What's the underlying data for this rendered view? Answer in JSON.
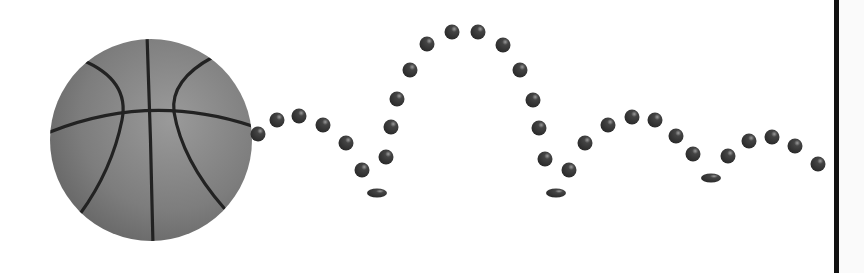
{
  "scene": {
    "title": "Bouncing basketball trajectory",
    "background": "#ffffff",
    "ball": {
      "cx": 151,
      "cy": 140,
      "r": 101,
      "fill_light": "#8a8a8a",
      "fill_dark": "#5a5a5a",
      "seam_color": "#222222"
    },
    "dot_color": "#333333",
    "dots": [
      {
        "x": 258,
        "y": 134,
        "r": 7.5
      },
      {
        "x": 277,
        "y": 120,
        "r": 7.5
      },
      {
        "x": 299,
        "y": 116,
        "r": 7.5
      },
      {
        "x": 323,
        "y": 125,
        "r": 7.5
      },
      {
        "x": 346,
        "y": 143,
        "r": 7.5
      },
      {
        "x": 362,
        "y": 170,
        "r": 7.5
      },
      {
        "x": 386,
        "y": 157,
        "r": 7.5
      },
      {
        "x": 391,
        "y": 127,
        "r": 7.5
      },
      {
        "x": 397,
        "y": 99,
        "r": 7.5
      },
      {
        "x": 410,
        "y": 70,
        "r": 7.5
      },
      {
        "x": 427,
        "y": 44,
        "r": 7.5
      },
      {
        "x": 452,
        "y": 32,
        "r": 7.5
      },
      {
        "x": 478,
        "y": 32,
        "r": 7.5
      },
      {
        "x": 503,
        "y": 45,
        "r": 7.5
      },
      {
        "x": 520,
        "y": 70,
        "r": 7.5
      },
      {
        "x": 533,
        "y": 100,
        "r": 7.5
      },
      {
        "x": 539,
        "y": 128,
        "r": 7.5
      },
      {
        "x": 545,
        "y": 159,
        "r": 7.5
      },
      {
        "x": 569,
        "y": 170,
        "r": 7.5
      },
      {
        "x": 585,
        "y": 143,
        "r": 7.5
      },
      {
        "x": 608,
        "y": 125,
        "r": 7.5
      },
      {
        "x": 632,
        "y": 117,
        "r": 7.5
      },
      {
        "x": 655,
        "y": 120,
        "r": 7.5
      },
      {
        "x": 676,
        "y": 136,
        "r": 7.5
      },
      {
        "x": 693,
        "y": 154,
        "r": 7.5
      },
      {
        "x": 728,
        "y": 156,
        "r": 7.5
      },
      {
        "x": 749,
        "y": 141,
        "r": 7.5
      },
      {
        "x": 772,
        "y": 137,
        "r": 7.5
      },
      {
        "x": 795,
        "y": 146,
        "r": 7.5
      },
      {
        "x": 818,
        "y": 164,
        "r": 7.5
      }
    ],
    "squashed_dots": [
      {
        "x": 377,
        "y": 193,
        "rx": 10,
        "ry": 4.5
      },
      {
        "x": 556,
        "y": 193,
        "rx": 10,
        "ry": 4.5
      },
      {
        "x": 711,
        "y": 178,
        "rx": 10,
        "ry": 4.5
      }
    ],
    "divider_color": "#111111"
  }
}
